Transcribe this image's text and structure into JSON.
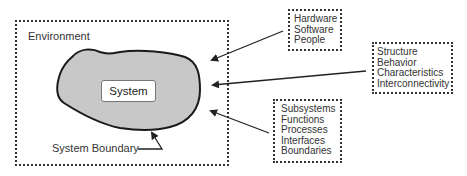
{
  "environment": {
    "label": "Environment"
  },
  "system": {
    "label": "System",
    "fill_color": "#c8c8c8"
  },
  "boundary": {
    "label": "System Boundary"
  },
  "groups": [
    {
      "id": "resources",
      "items": [
        "Hardware",
        "Software",
        "People"
      ]
    },
    {
      "id": "attributes",
      "items": [
        "Structure",
        "Behavior",
        "Characteristics",
        "Interconnectivity"
      ]
    },
    {
      "id": "elements",
      "items": [
        "Subsystems",
        "Functions",
        "Processes",
        "Interfaces",
        "Boundaries"
      ]
    }
  ]
}
